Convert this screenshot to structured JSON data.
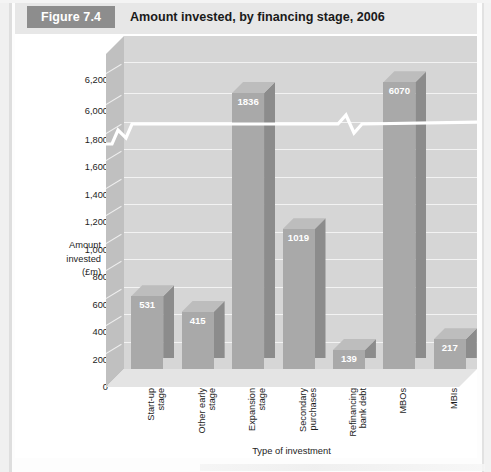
{
  "header": {
    "figure_badge": "Figure 7.4",
    "title": "Amount invested, by financing stage, 2006",
    "badge_color": "#8d8d8d",
    "band_color": "#e7e7e7"
  },
  "chart_data": {
    "type": "bar",
    "title": "Amount invested, by financing stage, 2006",
    "xlabel": "Type of investment",
    "ylabel": "Amount invested (£m)",
    "ylabel_lines": [
      "Amount",
      "invested",
      "(£m)"
    ],
    "categories": [
      "Start-up stage",
      "Other early stage",
      "Expansion stage",
      "Secondary purchases",
      "Refinancing bank debt",
      "MBOs",
      "MBIs"
    ],
    "category_lines": [
      [
        "Start-up",
        "stage"
      ],
      [
        "Other early",
        "stage"
      ],
      [
        "Expansion",
        "stage"
      ],
      [
        "Secondary",
        "purchases"
      ],
      [
        "Refinancing",
        "bank debt"
      ],
      [
        "MBOs",
        ""
      ],
      [
        "MBIs",
        ""
      ]
    ],
    "values": [
      531,
      415,
      1836,
      1019,
      139,
      6070,
      217
    ],
    "value_labels": [
      "531",
      "415",
      "1836",
      "1019",
      "139",
      "6070",
      "217"
    ],
    "ytick_labels": [
      "6,200",
      "6,000",
      "1,800",
      "1,600",
      "1,400",
      "1,200",
      "1,000",
      "800",
      "600",
      "400",
      "200",
      "0"
    ],
    "ytick_values": [
      6200,
      6000,
      1800,
      1600,
      1400,
      1200,
      1000,
      800,
      600,
      400,
      200,
      0
    ],
    "axis_break": true,
    "axis_break_between": [
      1800,
      6000
    ],
    "ylim": [
      0,
      6200
    ],
    "grid": true,
    "legend": "none",
    "bar_face_color": "#a9a9a9",
    "bar_side_color": "#8c8c8c",
    "bar_top_color": "#bdbdbd",
    "plot_background": "#d6d6d6",
    "gridline_color": "#f3f3f3",
    "value_label_color": "#ffffff"
  }
}
